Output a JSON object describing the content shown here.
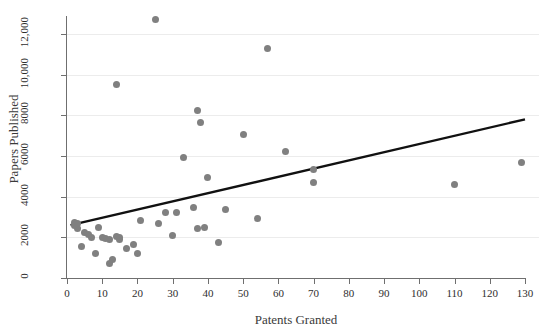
{
  "chart_data": {
    "type": "scatter",
    "title": "",
    "xlabel": "Patents Granted",
    "ylabel": "Papers Published",
    "xlim": [
      0,
      130
    ],
    "ylim": [
      0,
      13000
    ],
    "xticks": [
      0,
      10,
      20,
      30,
      40,
      50,
      60,
      70,
      80,
      90,
      100,
      110,
      120,
      130
    ],
    "xticklabels": [
      "0",
      "10",
      "20",
      "30",
      "40",
      "50",
      "60",
      "70",
      "80",
      "90",
      "100",
      "110",
      "120",
      "130"
    ],
    "yticks": [
      0,
      2000,
      4000,
      6000,
      8000,
      10000,
      12000
    ],
    "yticklabels": [
      "0",
      "2000",
      "4000",
      "6000",
      "8000",
      "10,000",
      "12,000"
    ],
    "grid": "horizontal",
    "legend": "none",
    "marker_color": "#808080",
    "line_color": "#111111",
    "gridline_color": "#ececec",
    "axis_color": "#6f6f6f",
    "points": [
      [
        2,
        2750
      ],
      [
        2,
        2600
      ],
      [
        3,
        2700
      ],
      [
        3,
        2450
      ],
      [
        4,
        1550
      ],
      [
        5,
        2250
      ],
      [
        6,
        2150
      ],
      [
        7,
        2000
      ],
      [
        8,
        1200
      ],
      [
        9,
        2500
      ],
      [
        10,
        2000
      ],
      [
        11,
        1950
      ],
      [
        12,
        1900
      ],
      [
        12,
        700
      ],
      [
        13,
        900
      ],
      [
        14,
        2050
      ],
      [
        14,
        9500
      ],
      [
        15,
        1900
      ],
      [
        15,
        2000
      ],
      [
        17,
        1450
      ],
      [
        19,
        1650
      ],
      [
        20,
        1200
      ],
      [
        21,
        2850
      ],
      [
        25,
        12700
      ],
      [
        26,
        2700
      ],
      [
        28,
        3200
      ],
      [
        30,
        2100
      ],
      [
        31,
        3200
      ],
      [
        33,
        5950
      ],
      [
        36,
        3450
      ],
      [
        37,
        8250
      ],
      [
        37,
        2450
      ],
      [
        38,
        7650
      ],
      [
        39,
        2500
      ],
      [
        40,
        4950
      ],
      [
        43,
        1750
      ],
      [
        45,
        3350
      ],
      [
        50,
        7050
      ],
      [
        54,
        2950
      ],
      [
        57,
        11300
      ],
      [
        62,
        6200
      ],
      [
        70,
        5350
      ],
      [
        70,
        4700
      ],
      [
        110,
        4600
      ],
      [
        129,
        5700
      ]
    ],
    "fit_line": {
      "x_start": 1,
      "y_start": 2600,
      "x_end": 130,
      "y_end": 7800
    }
  }
}
